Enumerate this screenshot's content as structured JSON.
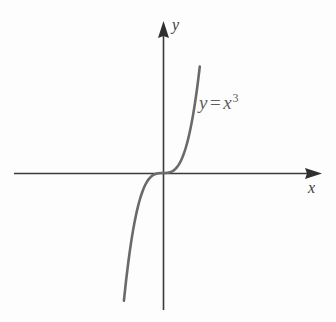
{
  "figure": {
    "kind": "cartesian-graph",
    "background_color": "#fdfdfd",
    "axis_color": "#3a3a3a",
    "curve_color": "#6a6a6a",
    "label_color": "#3d3d3d",
    "equation_color": "#5f5f5f"
  },
  "axes": {
    "x_label": "x",
    "y_label": "y",
    "origin": {
      "x": 163,
      "y": 173
    },
    "x_axis": {
      "start_x": 14,
      "end_x": 322,
      "y": 173,
      "arrow": "right"
    },
    "y_axis": {
      "x": 163,
      "start_y": 310,
      "end_y": 21,
      "arrow": "up"
    }
  },
  "curve": {
    "equation_base": "y",
    "equation_operator": "=",
    "equation_variable": "x",
    "equation_exponent": "3",
    "equation_plain": "y = x3"
  },
  "chart_data": {
    "type": "line",
    "title": "",
    "subtitle": "",
    "xlabel": "x",
    "ylabel": "y",
    "grid": false,
    "legend": null,
    "annotations": [
      {
        "text": "y = x^3",
        "x": 1.55,
        "y": 3.7
      }
    ],
    "axis_style": "arrow-ended cartesian axes through origin",
    "xlim": [
      -2.1,
      2.3
    ],
    "ylim": [
      -5.6,
      5.9
    ],
    "series": [
      {
        "name": "y = x^3",
        "color": "#6a6a6a",
        "x": [
          -1.7,
          -1.6,
          -1.5,
          -1.4,
          -1.3,
          -1.2,
          -1.1,
          -1.0,
          -0.9,
          -0.8,
          -0.7,
          -0.6,
          -0.5,
          -0.4,
          -0.3,
          -0.2,
          -0.1,
          0.0,
          0.1,
          0.2,
          0.3,
          0.4,
          0.5,
          0.6,
          0.7,
          0.8,
          0.9,
          1.0,
          1.1,
          1.2,
          1.3,
          1.4,
          1.5,
          1.6
        ],
        "y": [
          -4.913,
          -4.096,
          -3.375,
          -2.744,
          -2.197,
          -1.728,
          -1.331,
          -1.0,
          -0.729,
          -0.512,
          -0.343,
          -0.216,
          -0.125,
          -0.064,
          -0.027,
          -0.008,
          -0.001,
          0.0,
          0.001,
          0.008,
          0.027,
          0.064,
          0.125,
          0.216,
          0.343,
          0.512,
          0.729,
          1.0,
          1.331,
          1.728,
          2.197,
          2.744,
          3.375,
          4.096
        ]
      }
    ]
  }
}
